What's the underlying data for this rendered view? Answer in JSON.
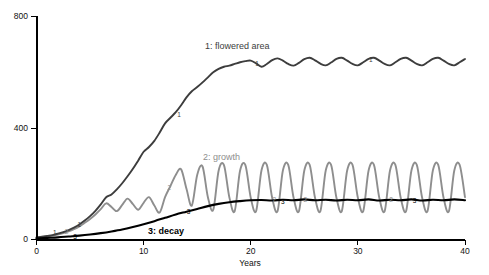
{
  "chart_data": {
    "type": "line",
    "title": "",
    "xlabel": "Years",
    "ylabel": "",
    "xlim": [
      0,
      40
    ],
    "ylim": [
      0,
      800
    ],
    "xticks": [
      0,
      10,
      20,
      30,
      40
    ],
    "yticks": [
      0,
      400,
      800
    ],
    "grid": false,
    "legend": "inline-annotations",
    "series": [
      {
        "name": "1: flowered area",
        "label": "1: flowered area",
        "color": "#3d3d3d",
        "marker_digit": "1",
        "x": [
          0,
          0.5,
          1,
          1.5,
          2,
          2.5,
          3,
          3.5,
          4,
          4.5,
          5,
          5.5,
          6,
          6.5,
          7,
          7.5,
          8,
          8.5,
          9,
          9.5,
          10,
          10.5,
          11,
          11.5,
          12,
          12.5,
          13,
          13.5,
          14,
          14.5,
          15,
          15.5,
          16,
          16.5,
          17,
          17.5,
          18,
          18.5,
          19,
          19.5,
          20,
          20.5,
          21,
          21.5,
          22,
          22.5,
          23,
          23.5,
          24,
          24.5,
          25,
          25.5,
          26,
          26.5,
          27,
          27.5,
          28,
          28.5,
          29,
          29.5,
          30,
          30.5,
          31,
          31.5,
          32,
          32.5,
          33,
          33.5,
          34,
          34.5,
          35,
          35.5,
          36,
          36.5,
          37,
          37.5,
          38,
          38.5,
          39,
          39.5,
          40
        ],
        "y": [
          6,
          8,
          11,
          14,
          19,
          25,
          32,
          41,
          52,
          66,
          82,
          101,
          124,
          150,
          160,
          178,
          200,
          225,
          252,
          282,
          313,
          330,
          352,
          382,
          415,
          435,
          455,
          480,
          508,
          530,
          545,
          562,
          580,
          598,
          610,
          618,
          622,
          628,
          634,
          638,
          640,
          630,
          618,
          628,
          642,
          648,
          640,
          628,
          622,
          632,
          645,
          650,
          641,
          629,
          623,
          633,
          646,
          650,
          640,
          628,
          623,
          634,
          646,
          650,
          640,
          628,
          623,
          634,
          646,
          650,
          640,
          628,
          623,
          634,
          646,
          650,
          640,
          628,
          623,
          634,
          646
        ]
      },
      {
        "name": "2: growth",
        "label": "2: growth",
        "color": "#8e8e8e",
        "marker_digit": "2",
        "x": [
          0,
          0.5,
          1,
          1.5,
          2,
          2.5,
          3,
          3.5,
          4,
          4.5,
          5,
          5.5,
          6,
          6.5,
          7,
          7.5,
          8,
          8.5,
          9,
          9.5,
          10,
          10.5,
          11,
          11.5,
          12,
          12.5,
          13,
          13.5,
          14,
          14.5,
          15,
          15.5,
          16,
          16.5,
          17,
          17.5,
          18,
          18.5,
          19,
          19.5,
          20,
          20.5,
          21,
          21.5,
          22,
          22.5,
          23,
          23.5,
          24,
          24.5,
          25,
          25.5,
          26,
          26.5,
          27,
          27.5,
          28,
          28.5,
          29,
          29.5,
          30,
          30.5,
          31,
          31.5,
          32,
          32.5,
          33,
          33.5,
          34,
          34.5,
          35,
          35.5,
          36,
          36.5,
          37,
          37.5,
          38,
          38.5,
          39,
          39.5,
          40
        ],
        "y": [
          4,
          6,
          9,
          12,
          16,
          21,
          27,
          35,
          45,
          58,
          72,
          88,
          107,
          128,
          115,
          100,
          122,
          145,
          125,
          105,
          130,
          150,
          120,
          95,
          150,
          190,
          230,
          250,
          180,
          120,
          230,
          260,
          150,
          105,
          245,
          265,
          150,
          100,
          245,
          265,
          148,
          100,
          246,
          266,
          148,
          100,
          246,
          266,
          148,
          100,
          246,
          266,
          148,
          100,
          246,
          266,
          148,
          100,
          246,
          266,
          148,
          100,
          246,
          266,
          148,
          100,
          246,
          266,
          148,
          100,
          246,
          266,
          148,
          100,
          246,
          266,
          148,
          100,
          246,
          266,
          150
        ]
      },
      {
        "name": "3: decay",
        "label": "3: decay",
        "color": "#000000",
        "marker_digit": "3",
        "x": [
          0,
          1,
          2,
          3,
          4,
          5,
          6,
          7,
          8,
          9,
          10,
          11,
          12,
          13,
          14,
          15,
          16,
          17,
          18,
          19,
          20,
          21,
          22,
          23,
          24,
          25,
          26,
          27,
          28,
          29,
          30,
          31,
          32,
          33,
          34,
          35,
          36,
          37,
          38,
          39,
          40
        ],
        "y": [
          2,
          4,
          6,
          9,
          12,
          16,
          21,
          27,
          34,
          43,
          53,
          64,
          76,
          88,
          98,
          108,
          118,
          126,
          132,
          136,
          139,
          140,
          138,
          141,
          139,
          142,
          139,
          141,
          138,
          141,
          139,
          142,
          138,
          141,
          139,
          142,
          138,
          141,
          139,
          142,
          139
        ]
      }
    ],
    "markers": [
      {
        "series": "1: flowered area",
        "digit": "1",
        "x": 1.7,
        "y": 25
      },
      {
        "series": "1: flowered area",
        "digit": "1",
        "x": 4.0,
        "y": 55
      },
      {
        "series": "1: flowered area",
        "digit": "1",
        "x": 13.3,
        "y": 450
      },
      {
        "series": "1: flowered area",
        "digit": "1",
        "x": 20.6,
        "y": 632
      },
      {
        "series": "1: flowered area",
        "digit": "1",
        "x": 31.2,
        "y": 646
      },
      {
        "series": "2: growth",
        "digit": "2",
        "x": 2.8,
        "y": 30
      },
      {
        "series": "2: growth",
        "digit": "2",
        "x": 12.4,
        "y": 185
      },
      {
        "series": "2: growth",
        "digit": "2",
        "x": 22.2,
        "y": 145
      },
      {
        "series": "2: growth",
        "digit": "2",
        "x": 25.1,
        "y": 143
      },
      {
        "series": "2: growth",
        "digit": "2",
        "x": 33.1,
        "y": 143
      },
      {
        "series": "3: decay",
        "digit": "3",
        "x": 3.6,
        "y": 12
      },
      {
        "series": "3: decay",
        "digit": "3",
        "x": 14.2,
        "y": 100
      },
      {
        "series": "3: decay",
        "digit": "3",
        "x": 23.0,
        "y": 138
      },
      {
        "series": "3: decay",
        "digit": "3",
        "x": 35.3,
        "y": 139
      }
    ]
  },
  "axis": {
    "x_title": "Years",
    "x_tick_labels": [
      "0",
      "10",
      "20",
      "30",
      "40"
    ],
    "y_tick_labels": [
      "0",
      "400",
      "800"
    ]
  },
  "labels": {
    "flowered_area": "1: flowered area",
    "growth": "2: growth",
    "decay": "3: decay"
  },
  "colors": {
    "series1": "#3d3d3d",
    "series2": "#8e8e8e",
    "series3": "#000000",
    "axis": "#000000",
    "background": "#ffffff"
  }
}
